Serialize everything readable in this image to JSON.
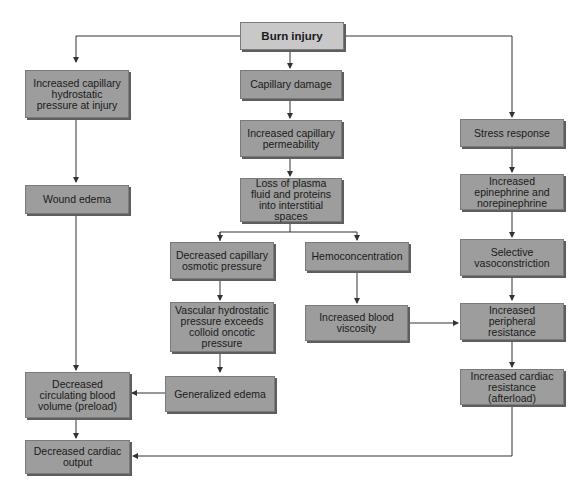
{
  "diagram": {
    "title": "Burn injury",
    "nodes": {
      "burn_injury": "Burn injury",
      "increased_capillary_hydrostatic": "Increased capillary hydrostatic pressure at injury",
      "wound_edema": "Wound edema",
      "capillary_damage": "Capillary damage",
      "increased_capillary_permeability": "Increased capillary permeability",
      "loss_of_plasma": "Loss of plasma fluid and proteins into interstitial spaces",
      "decreased_capillary_osmotic": "Decreased capillary osmotic pressure",
      "hemoconcentration": "Hemoconcentration",
      "vascular_hydrostatic": "Vascular hydrostatic pressure exceeds colloid oncotic pressure",
      "increased_blood_viscosity": "Increased blood viscosity",
      "generalized_edema": "Generalized edema",
      "stress_response": "Stress response",
      "increased_epinephrine": "Increased epinephrine and norepinephrine",
      "selective_vasoconstriction": "Selective vasoconstriction",
      "increased_peripheral_resistance": "Increased peripheral resistance",
      "increased_cardiac_resistance": "Increased cardiac resistance (afterload)",
      "decreased_circulating_volume": "Decreased circulating blood volume (preload)",
      "decreased_cardiac_output": "Decreased cardiac output"
    },
    "edges": [
      [
        "burn_injury",
        "increased_capillary_hydrostatic"
      ],
      [
        "burn_injury",
        "capillary_damage"
      ],
      [
        "burn_injury",
        "stress_response"
      ],
      [
        "increased_capillary_hydrostatic",
        "wound_edema"
      ],
      [
        "wound_edema",
        "decreased_circulating_volume"
      ],
      [
        "capillary_damage",
        "increased_capillary_permeability"
      ],
      [
        "increased_capillary_permeability",
        "loss_of_plasma"
      ],
      [
        "loss_of_plasma",
        "decreased_capillary_osmotic"
      ],
      [
        "loss_of_plasma",
        "hemoconcentration"
      ],
      [
        "decreased_capillary_osmotic",
        "vascular_hydrostatic"
      ],
      [
        "vascular_hydrostatic",
        "generalized_edema"
      ],
      [
        "generalized_edema",
        "decreased_circulating_volume"
      ],
      [
        "hemoconcentration",
        "increased_blood_viscosity"
      ],
      [
        "increased_blood_viscosity",
        "increased_peripheral_resistance"
      ],
      [
        "stress_response",
        "increased_epinephrine"
      ],
      [
        "increased_epinephrine",
        "selective_vasoconstriction"
      ],
      [
        "selective_vasoconstriction",
        "increased_peripheral_resistance"
      ],
      [
        "increased_peripheral_resistance",
        "increased_cardiac_resistance"
      ],
      [
        "increased_cardiac_resistance",
        "decreased_cardiac_output"
      ],
      [
        "decreased_circulating_volume",
        "decreased_cardiac_output"
      ]
    ],
    "colors": {
      "box_fill": "#9d9d9d",
      "root_fill": "#c8c8c8",
      "line": "#333333",
      "background": "#ffffff"
    }
  }
}
